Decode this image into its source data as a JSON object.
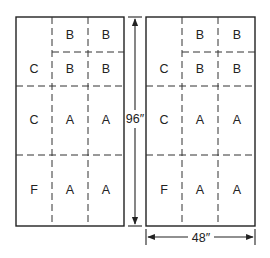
{
  "diagram": {
    "panels": [
      {
        "name": "left-panel",
        "cells": [
          {
            "label": "C",
            "row": "top",
            "col": 0
          },
          {
            "label": "B",
            "row": "top-upper",
            "col": 1
          },
          {
            "label": "B",
            "row": "top-upper",
            "col": 2
          },
          {
            "label": "B",
            "row": "top-lower",
            "col": 1
          },
          {
            "label": "B",
            "row": "top-lower",
            "col": 2
          },
          {
            "label": "C",
            "row": "middle",
            "col": 0
          },
          {
            "label": "A",
            "row": "middle",
            "col": 1
          },
          {
            "label": "A",
            "row": "middle",
            "col": 2
          },
          {
            "label": "F",
            "row": "bottom",
            "col": 0
          },
          {
            "label": "A",
            "row": "bottom",
            "col": 1
          },
          {
            "label": "A",
            "row": "bottom",
            "col": 2
          }
        ]
      },
      {
        "name": "right-panel",
        "cells": [
          {
            "label": "C",
            "row": "top",
            "col": 0
          },
          {
            "label": "B",
            "row": "top-upper",
            "col": 1
          },
          {
            "label": "B",
            "row": "top-upper",
            "col": 2
          },
          {
            "label": "B",
            "row": "top-lower",
            "col": 1
          },
          {
            "label": "B",
            "row": "top-lower",
            "col": 2
          },
          {
            "label": "C",
            "row": "middle",
            "col": 0
          },
          {
            "label": "A",
            "row": "middle",
            "col": 1
          },
          {
            "label": "A",
            "row": "middle",
            "col": 2
          },
          {
            "label": "F",
            "row": "bottom",
            "col": 0
          },
          {
            "label": "A",
            "row": "bottom",
            "col": 1
          },
          {
            "label": "A",
            "row": "bottom",
            "col": 2
          }
        ]
      }
    ],
    "dimensions": {
      "height_label": "96″",
      "width_label": "48″"
    }
  }
}
